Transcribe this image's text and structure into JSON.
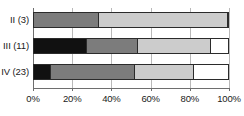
{
  "chart_data": {
    "type": "bar",
    "orientation": "horizontal",
    "stacked": true,
    "normalized": "100%",
    "title": "",
    "subtitle": "",
    "xlabel": "",
    "ylabel": "",
    "xlim": [
      0,
      100
    ],
    "grid": "vertical",
    "legend": "none",
    "categories": [
      "II (3)",
      "III (11)",
      "IV (23)"
    ],
    "xticks": [
      0,
      20,
      40,
      60,
      80,
      100
    ],
    "xticklabels": [
      "0%",
      "20%",
      "40%",
      "60%",
      "80%",
      "100%"
    ],
    "series": [
      {
        "name": "Segment 1",
        "color": "#111111",
        "values": [
          0,
          27.5,
          9.0
        ]
      },
      {
        "name": "Segment 2",
        "color": "#7c7c7c",
        "values": [
          33.5,
          26.1,
          43.0
        ]
      },
      {
        "name": "Segment 3",
        "color": "#cccccc",
        "values": [
          66.5,
          37.4,
          30.6
        ]
      },
      {
        "name": "Segment 4",
        "color": "#ffffff",
        "values": [
          0,
          9.0,
          17.4
        ]
      }
    ],
    "bars": [
      {
        "label": "II (3)",
        "segments": [
          {
            "color": "#111111",
            "value": 0
          },
          {
            "color": "#7c7c7c",
            "value": 33.5
          },
          {
            "color": "#cccccc",
            "value": 66.5
          },
          {
            "color": "#ffffff",
            "value": 0
          }
        ]
      },
      {
        "label": "III (11)",
        "segments": [
          {
            "color": "#111111",
            "value": 27.5
          },
          {
            "color": "#7c7c7c",
            "value": 26.1
          },
          {
            "color": "#cccccc",
            "value": 37.4
          },
          {
            "color": "#ffffff",
            "value": 9.0
          }
        ]
      },
      {
        "label": "IV (23)",
        "segments": [
          {
            "color": "#111111",
            "value": 9.0
          },
          {
            "color": "#7c7c7c",
            "value": 43.0
          },
          {
            "color": "#cccccc",
            "value": 30.6
          },
          {
            "color": "#ffffff",
            "value": 17.4
          }
        ]
      }
    ],
    "style": {
      "bar_border_color": "#2b2b2b",
      "gridline_color": "#b9b9b9",
      "axis_color": "#6e6e6e",
      "text_color": "#1a1a1a",
      "background": "#ffffff"
    }
  }
}
